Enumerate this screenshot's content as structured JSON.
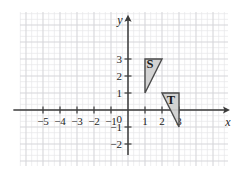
{
  "figure": {
    "kind": "coordinate-grid-plot",
    "background_color": "#ffffff",
    "grid": {
      "minor_color": "#e8e8ea",
      "major_color": "#d6d6da",
      "minor_step_px": 5.667,
      "major_every_minor": 3,
      "left_px": 20,
      "top_px": 12,
      "right_px": 228,
      "bottom_px": 166
    },
    "axes": {
      "color": "#3b3b3b",
      "origin_px": {
        "x": 128,
        "y": 110
      },
      "unit_px": 17,
      "x_axis": {
        "label": "x",
        "label_style": "italic",
        "arrow": "right",
        "range": [
          -6.7,
          6.0
        ],
        "ticks": [
          {
            "value": -5,
            "label": "−5"
          },
          {
            "value": -4,
            "label": "−4"
          },
          {
            "value": -3,
            "label": "−3"
          },
          {
            "value": -2,
            "label": "−2"
          },
          {
            "value": -1,
            "label": "−1"
          },
          {
            "value": 1,
            "label": "1"
          },
          {
            "value": 2,
            "label": "2"
          },
          {
            "value": 3,
            "label": "3"
          }
        ]
      },
      "y_axis": {
        "label": "y",
        "label_style": "italic",
        "arrow": "up",
        "range": [
          -2.6,
          5.6
        ],
        "ticks": [
          {
            "value": 3,
            "label": "3"
          },
          {
            "value": 2,
            "label": "2"
          },
          {
            "value": 1,
            "label": "1"
          },
          {
            "value": -1,
            "label": "−1"
          },
          {
            "value": -2,
            "label": "−2"
          }
        ]
      },
      "origin_label": "0"
    },
    "shapes": [
      {
        "name": "triangle-s",
        "label": "S",
        "label_at": {
          "x": 1.3,
          "y": 2.45
        },
        "vertices": [
          {
            "x": 1,
            "y": 3
          },
          {
            "x": 2,
            "y": 3
          },
          {
            "x": 1,
            "y": 1
          }
        ],
        "fill_color": "#cfcfcf",
        "stroke_color": "#4a4a4a"
      },
      {
        "name": "triangle-t",
        "label": "T",
        "label_at": {
          "x": 2.52,
          "y": 0.38
        },
        "vertices": [
          {
            "x": 2,
            "y": 1
          },
          {
            "x": 3,
            "y": 1
          },
          {
            "x": 3,
            "y": -1
          }
        ],
        "fill_color": "#cfcfcf",
        "stroke_color": "#4a4a4a"
      }
    ]
  },
  "chart_data": {
    "type": "scatter",
    "title": "",
    "xlabel": "x",
    "ylabel": "y",
    "xlim": [
      -6.7,
      6.0
    ],
    "ylim": [
      -2.6,
      5.6
    ],
    "grid": true,
    "legend": "none",
    "xticks": [
      -5,
      -4,
      -3,
      -2,
      -1,
      0,
      1,
      2,
      3
    ],
    "yticks": [
      -2,
      -1,
      0,
      1,
      2,
      3
    ],
    "annotations": [
      {
        "text": "S",
        "x": 1.3,
        "y": 2.45
      },
      {
        "text": "T",
        "x": 2.52,
        "y": 0.38
      }
    ],
    "series": [
      {
        "name": "S",
        "kind": "polygon",
        "x": [
          1,
          2,
          1
        ],
        "y": [
          3,
          3,
          1
        ],
        "fill": "#cfcfcf",
        "edge": "#4a4a4a"
      },
      {
        "name": "T",
        "kind": "polygon",
        "x": [
          2,
          3,
          3
        ],
        "y": [
          1,
          1,
          -1
        ],
        "fill": "#cfcfcf",
        "edge": "#4a4a4a"
      }
    ]
  }
}
